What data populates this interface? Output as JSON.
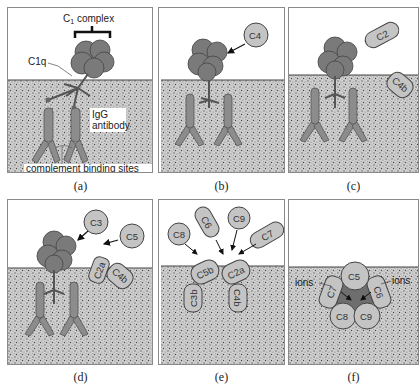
{
  "figure": {
    "panels": [
      {
        "id": "a",
        "caption": "(a)",
        "labels": {
          "c1_complex": "C",
          "c1_sub": "1",
          "c1_rest": " complex",
          "c1q": "C1q",
          "igg1": "IgG",
          "igg2": "antibody",
          "binding_sites": "complement binding sites"
        }
      },
      {
        "id": "b",
        "caption": "(b)",
        "molecules": [
          "C4"
        ]
      },
      {
        "id": "c",
        "caption": "(c)",
        "molecules": [
          "C2",
          "C4b"
        ]
      },
      {
        "id": "d",
        "caption": "(d)",
        "molecules": [
          "C3",
          "C5",
          "C2a",
          "C4b"
        ]
      },
      {
        "id": "e",
        "caption": "(e)",
        "molecules": [
          "C8",
          "C6",
          "C9",
          "C7",
          "C5b",
          "C2a",
          "C3b",
          "C4b"
        ]
      },
      {
        "id": "f",
        "caption": "(f)",
        "molecules": [
          "C5",
          "C7",
          "C6",
          "C8",
          "C9"
        ],
        "labels": {
          "ions_left": "ions",
          "ions_right": "ions"
        }
      }
    ]
  },
  "colors": {
    "complex_fill": "#7a7a7a",
    "antibody_fill": "#8c8c8c",
    "molecule_fill": "#c4c4c4",
    "pore_fill": "#6e6e6e",
    "membrane_bg": "#d4d4d4",
    "outline": "#444444"
  }
}
